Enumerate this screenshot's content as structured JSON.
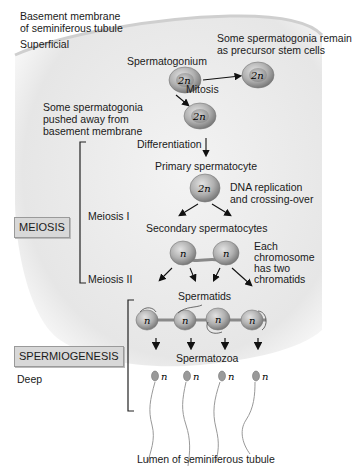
{
  "labels": {
    "basement_membrane": "Basement membrane",
    "basement_membrane_2": "of seminiferous tubule",
    "superficial": "Superficial",
    "spermatogonium": "Spermatogonium",
    "stem_cells_1": "Some spermatogonia remain",
    "stem_cells_2": "as precursor stem cells",
    "mitosis": "Mitosis",
    "pushed_1": "Some spermatogonia",
    "pushed_2": "pushed away from",
    "pushed_3": "basement membrane",
    "differentiation": "Differentiation",
    "primary_spermatocyte": "Primary spermatocyte",
    "dna_1": "DNA replication",
    "dna_2": "and crossing-over",
    "meiosis_i": "Meiosis I",
    "secondary_spermatocytes": "Secondary spermatocytes",
    "chromatid_1": "Each",
    "chromatid_2": "chromosome",
    "chromatid_3": "has two",
    "chromatid_4": "chromatids",
    "meiosis_ii": "Meiosis II",
    "spermatids": "Spermatids",
    "spermatozoa": "Spermatozoa",
    "deep": "Deep",
    "lumen": "Lumen of seminiferous tubule"
  },
  "boxes": {
    "meiosis": "MEIOSIS",
    "spermiogenesis": "SPERMIOGENESIS"
  },
  "cells": {
    "diploid": "2n",
    "haploid": "n"
  },
  "colors": {
    "cell_fill": "#a9a9a9",
    "tissue_bg": "#ececec",
    "arrow": "#111111"
  }
}
